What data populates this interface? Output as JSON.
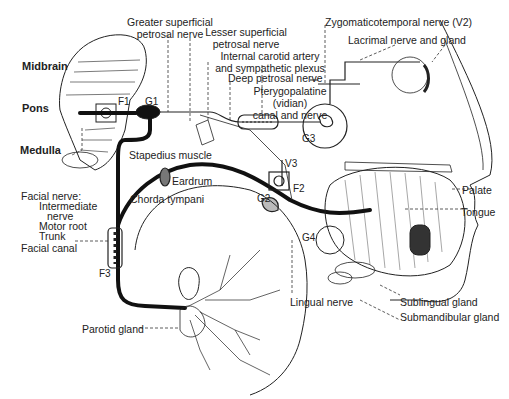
{
  "diagram": {
    "brain_regions": [
      {
        "id": "midbrain",
        "label": "Midbrain",
        "x": 22,
        "y": 59
      },
      {
        "id": "pons",
        "label": "Pons",
        "x": 22,
        "y": 101
      },
      {
        "id": "medulla",
        "label": "Medulla",
        "x": 20,
        "y": 144
      }
    ],
    "markers": [
      {
        "id": "F1",
        "label": "F1",
        "x": 118,
        "y": 96
      },
      {
        "id": "G1",
        "label": "G1",
        "x": 145,
        "y": 96
      },
      {
        "id": "G2",
        "label": "G2",
        "x": 257,
        "y": 193
      },
      {
        "id": "F2",
        "label": "F2",
        "x": 296,
        "y": 200
      },
      {
        "id": "V3",
        "label": "V3",
        "x": 283,
        "y": 159
      },
      {
        "id": "G3",
        "label": "G3",
        "x": 302,
        "y": 133
      },
      {
        "id": "G4",
        "label": "G4",
        "x": 302,
        "y": 232
      },
      {
        "id": "F3",
        "label": "F3",
        "x": 99,
        "y": 268
      }
    ],
    "labels": {
      "greater_superficial": [
        "Greater superficial",
        "petrosal nerve"
      ],
      "lesser_superficial": [
        "Lesser superficial",
        "petrosal nerve"
      ],
      "internal_carotid": [
        "Internal carotid artery",
        "and sympathetic plexus"
      ],
      "deep_petrosal": "Deep petrosal nerve",
      "pterygopalatine": [
        "Pterygopalatine",
        "(vidian)",
        "canal and nerve"
      ],
      "zygomaticotemporal": "Zygomaticotemporal nerve (V2)",
      "lacrimal": "Lacrimal nerve and gland",
      "stapedius": "Stapedius muscle",
      "eardrum": "Eardrum",
      "chorda_tympani": "Chorda tympani",
      "facial_nerve": [
        "Facial nerve:",
        "Intermediate",
        "nerve",
        "Motor root",
        "Trunk"
      ],
      "facial_canal": "Facial canal",
      "palate": "Palate",
      "tongue": "Tongue",
      "lingual_nerve": "Lingual nerve",
      "sublingual_gland": "Sublingual gland",
      "submandibular_gland": "Submandibular gland",
      "parotid_gland": "Parotid gland"
    }
  }
}
